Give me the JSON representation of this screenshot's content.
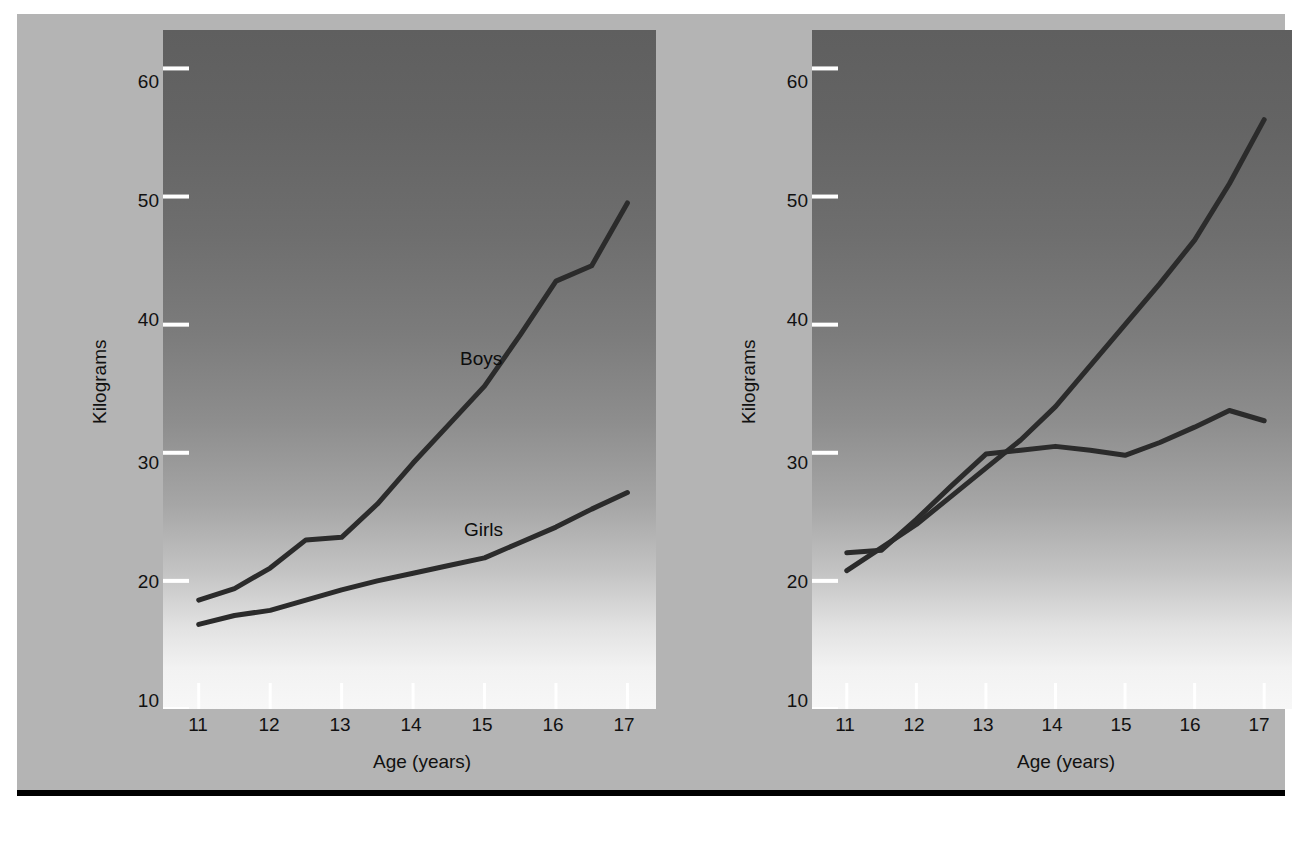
{
  "figure": {
    "background_color": "#b4b4b4",
    "rule_color": "#000000"
  },
  "axis": {
    "xlabel": "Age (years)",
    "ylabel": "Kilograms",
    "yticks": [
      "60",
      "50",
      "40",
      "30",
      "20",
      "10"
    ],
    "xticks": [
      "11",
      "12",
      "13",
      "14",
      "15",
      "16",
      "17"
    ]
  },
  "charts": {
    "left": {
      "title": "Strength of arm pull"
    },
    "right": {
      "title": "Strength of arm thrust"
    }
  },
  "series_labels": {
    "boys": "Boys",
    "girls": "Girls"
  },
  "chart_data": [
    {
      "type": "line",
      "title": "Strength of arm pull",
      "xlabel": "Age (years)",
      "ylabel": "Kilograms",
      "xlim": [
        10.5,
        17.4
      ],
      "ylim": [
        10,
        63
      ],
      "xticks": [
        11,
        12,
        13,
        14,
        15,
        16,
        17
      ],
      "yticks": [
        10,
        20,
        30,
        40,
        50,
        60
      ],
      "grid": false,
      "legend": "inline-annotation",
      "line_color": "#2b2b2b",
      "series": [
        {
          "name": "Boys",
          "x": [
            11.0,
            11.5,
            12.0,
            12.5,
            13.0,
            13.5,
            14.0,
            14.5,
            15.0,
            15.5,
            16.0,
            16.5,
            17.0
          ],
          "values": [
            18.5,
            19.4,
            21.0,
            23.2,
            23.4,
            26.0,
            29.2,
            32.2,
            35.2,
            39.2,
            43.4,
            44.6,
            49.5
          ]
        },
        {
          "name": "Girls",
          "x": [
            11.0,
            11.5,
            12.0,
            12.5,
            13.0,
            13.5,
            14.0,
            14.5,
            15.0,
            15.5,
            16.0,
            16.5,
            17.0
          ],
          "values": [
            16.6,
            17.3,
            17.7,
            18.5,
            19.3,
            20.0,
            20.6,
            21.2,
            21.8,
            23.0,
            24.2,
            25.6,
            26.9
          ]
        }
      ]
    },
    {
      "type": "line",
      "title": "Strength of arm thrust",
      "xlabel": "Age (years)",
      "ylabel": "Kilograms",
      "xlim": [
        10.5,
        17.4
      ],
      "ylim": [
        10,
        63
      ],
      "xticks": [
        11,
        12,
        13,
        14,
        15,
        16,
        17
      ],
      "yticks": [
        10,
        20,
        30,
        40,
        50,
        60
      ],
      "grid": false,
      "legend": "inline-annotation",
      "line_color": "#2b2b2b",
      "series": [
        {
          "name": "Boys",
          "x": [
            11.0,
            11.5,
            12.0,
            12.5,
            13.0,
            13.5,
            14.0,
            14.5,
            15.0,
            15.5,
            16.0,
            16.5,
            17.0
          ],
          "values": [
            20.8,
            22.6,
            24.4,
            26.6,
            28.8,
            31.0,
            33.6,
            36.8,
            40.0,
            43.2,
            46.6,
            51.0,
            56.0
          ]
        },
        {
          "name": "Girls",
          "x": [
            11.0,
            11.5,
            12.0,
            12.5,
            13.0,
            13.5,
            14.0,
            14.5,
            15.0,
            15.5,
            16.0,
            16.5,
            17.0
          ],
          "values": [
            22.2,
            22.4,
            24.8,
            27.4,
            29.9,
            30.2,
            30.5,
            30.2,
            29.8,
            30.8,
            32.0,
            33.3,
            32.5
          ]
        }
      ]
    }
  ]
}
